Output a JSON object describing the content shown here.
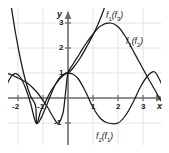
{
  "figure": {
    "background": "#ffffff",
    "grid_color": "#d8dde3",
    "axis_color": "#6e6e72",
    "curve_color": "#1a1a1a",
    "border_color": "#ffffff"
  },
  "axes": {
    "x_name": "x",
    "y_name": "y",
    "x_ticks": [
      {
        "value": -2,
        "label": "-2"
      },
      {
        "value": -1,
        "label": "-1"
      },
      {
        "value": 1,
        "label": "1"
      },
      {
        "value": 2,
        "label": "2"
      },
      {
        "value": 3,
        "label": "3"
      }
    ],
    "y_ticks": [
      {
        "value": 3,
        "label": "3"
      },
      {
        "value": 2,
        "label": "2"
      },
      {
        "value": 1,
        "label": "1"
      },
      {
        "value": -1,
        "label": "-1"
      }
    ],
    "xlim": [
      -2.6,
      3.8
    ],
    "ylim": [
      -1.7,
      4.0
    ],
    "origin_px": {
      "x": 68,
      "y": 98
    },
    "unit_px": 25
  },
  "curve_labels": [
    {
      "id": "f1f3",
      "base": "f",
      "sub1": "1",
      "arg_base": "f",
      "arg_sub": "3",
      "text": "f1(f3)",
      "x_px": 106,
      "y_px": 11
    },
    {
      "id": "f1f2",
      "base": "f",
      "sub1": "1",
      "arg_base": "f",
      "arg_sub": "2",
      "text": "f1(f2)",
      "x_px": 126,
      "y_px": 37
    },
    {
      "id": "f2f1",
      "base": "f",
      "sub1": "2",
      "arg_base": "f",
      "arg_sub": "1",
      "text": "f2(f1)",
      "x_px": 96,
      "y_px": 132
    }
  ],
  "chart_data": {
    "type": "line",
    "title": "",
    "xlabel": "x",
    "ylabel": "y",
    "xlim": [
      -2.6,
      3.8
    ],
    "ylim": [
      -1.7,
      4.0
    ],
    "grid": true,
    "legend": "inline-annotations",
    "series": [
      {
        "name": "f1(f3)",
        "description": "steep upward parabola, vertex near (-1.25, -1.05), passes (0,1) rising steeply",
        "points": [
          [
            -2.3,
            3.85
          ],
          [
            -2.1,
            2.6
          ],
          [
            -1.9,
            1.55
          ],
          [
            -1.7,
            0.7
          ],
          [
            -1.5,
            0.08
          ],
          [
            -1.3,
            -0.3
          ],
          [
            -1.25,
            -1.02
          ],
          [
            -1.1,
            -0.55
          ],
          [
            -0.9,
            -0.15
          ],
          [
            -0.7,
            0.25
          ],
          [
            -0.5,
            0.55
          ],
          [
            -0.3,
            0.8
          ],
          [
            -0.1,
            0.96
          ],
          [
            0.0,
            1.0
          ],
          [
            0.2,
            1.2
          ],
          [
            0.5,
            1.62
          ],
          [
            0.8,
            2.15
          ],
          [
            1.0,
            2.52
          ],
          [
            1.2,
            2.95
          ],
          [
            1.4,
            3.45
          ],
          [
            1.55,
            3.9
          ]
        ]
      },
      {
        "name": "f1(f2)",
        "description": "wave rising from (0,1) to maximum 3 near x=1.7, then descending through x=3.3",
        "points": [
          [
            -2.4,
            0.98
          ],
          [
            -2.2,
            0.9
          ],
          [
            -2.0,
            0.8
          ],
          [
            -1.8,
            0.7
          ],
          [
            -1.6,
            0.58
          ],
          [
            -1.4,
            0.4
          ],
          [
            -1.2,
            0.18
          ],
          [
            -1.0,
            -0.1
          ],
          [
            -0.8,
            -0.4
          ],
          [
            -0.6,
            -0.75
          ],
          [
            -0.4,
            -1.0
          ],
          [
            -0.2,
            -0.6
          ],
          [
            -0.1,
            0.2
          ],
          [
            0.0,
            1.0
          ],
          [
            0.2,
            1.35
          ],
          [
            0.45,
            1.75
          ],
          [
            0.7,
            2.15
          ],
          [
            1.0,
            2.55
          ],
          [
            1.3,
            2.88
          ],
          [
            1.7,
            3.0
          ],
          [
            2.0,
            2.85
          ],
          [
            2.3,
            2.45
          ],
          [
            2.6,
            1.9
          ],
          [
            2.9,
            1.35
          ],
          [
            3.2,
            0.8
          ],
          [
            3.5,
            0.28
          ],
          [
            3.7,
            -0.1
          ]
        ]
      },
      {
        "name": "f2(f1)",
        "description": "cosine-like wave: local max near (-2.1, 1.0), minimum -1 near (-1.3,-1) and (2,-1), crossing (0,1)",
        "points": [
          [
            -2.5,
            0.4
          ],
          [
            -2.3,
            0.82
          ],
          [
            -2.1,
            0.98
          ],
          [
            -1.9,
            0.82
          ],
          [
            -1.7,
            0.4
          ],
          [
            -1.5,
            -0.2
          ],
          [
            -1.35,
            -0.8
          ],
          [
            -1.25,
            -1.02
          ],
          [
            -1.1,
            -0.85
          ],
          [
            -0.9,
            -0.4
          ],
          [
            -0.7,
            0.1
          ],
          [
            -0.5,
            0.55
          ],
          [
            -0.3,
            0.85
          ],
          [
            -0.1,
            0.99
          ],
          [
            0.0,
            1.0
          ],
          [
            0.2,
            0.95
          ],
          [
            0.4,
            0.78
          ],
          [
            0.6,
            0.45
          ],
          [
            0.8,
            0.05
          ],
          [
            1.0,
            -0.38
          ],
          [
            1.3,
            -0.82
          ],
          [
            1.6,
            -1.0
          ],
          [
            2.0,
            -1.0
          ],
          [
            2.3,
            -0.7
          ],
          [
            2.6,
            -0.18
          ],
          [
            2.9,
            0.45
          ],
          [
            3.2,
            0.9
          ],
          [
            3.45,
            1.05
          ],
          [
            3.6,
            0.85
          ],
          [
            3.75,
            0.55
          ]
        ]
      }
    ]
  }
}
